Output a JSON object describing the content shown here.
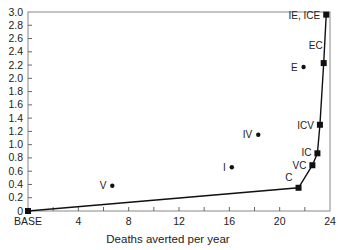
{
  "chart_data": {
    "type": "scatter",
    "title": "",
    "xlabel": "Deaths averted per year",
    "ylabel": "",
    "xlim": [
      0,
      24
    ],
    "ylim": [
      0,
      3.0
    ],
    "grid": false,
    "legend": null,
    "x_tick_labels": [
      {
        "x": 0,
        "label": "BASE"
      },
      {
        "x": 4,
        "label": "4"
      },
      {
        "x": 8,
        "label": "8"
      },
      {
        "x": 12,
        "label": "12"
      },
      {
        "x": 16,
        "label": "16"
      },
      {
        "x": 20,
        "label": "20"
      },
      {
        "x": 24,
        "label": "24"
      }
    ],
    "x_minor_step": 2,
    "y_tick_labels": [
      "0",
      "0.2",
      "0.4",
      "0.6",
      "0.8",
      "1.0",
      "1.2",
      "1.4",
      "1.6",
      "1.8",
      "2.0",
      "2.2",
      "2.4",
      "2.6",
      "2.8",
      "3.0"
    ],
    "y_step": 0.2,
    "series": [
      {
        "name": "Efficient frontier",
        "marker": "square",
        "line": true,
        "points": [
          {
            "label": "BASE",
            "x": 0,
            "y": 0,
            "show_label": false
          },
          {
            "label": "C",
            "x": 21.5,
            "y": 0.35
          },
          {
            "label": "VC",
            "x": 22.6,
            "y": 0.69
          },
          {
            "label": "IC",
            "x": 23.0,
            "y": 0.87
          },
          {
            "label": "ICV",
            "x": 23.2,
            "y": 1.3
          },
          {
            "label": "EC",
            "x": 23.5,
            "y": 2.23
          },
          {
            "label": "IE, ICE",
            "x": 23.7,
            "y": 2.96
          }
        ]
      },
      {
        "name": "Dominated strategies",
        "marker": "circle",
        "line": false,
        "points": [
          {
            "label": "V",
            "x": 6.7,
            "y": 0.38
          },
          {
            "label": "I",
            "x": 16.2,
            "y": 0.66
          },
          {
            "label": "IV",
            "x": 18.3,
            "y": 1.15
          },
          {
            "label": "E",
            "x": 21.9,
            "y": 2.17
          }
        ]
      }
    ]
  }
}
